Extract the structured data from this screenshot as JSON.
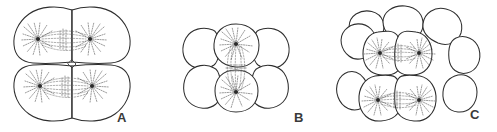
{
  "figure": {
    "type": "scientific-line-drawing",
    "background_color": "#ffffff",
    "ink_color": "#2e2e2e",
    "detail_color": "#6d6d6d",
    "width": 497,
    "height": 132
  },
  "panels": [
    {
      "label": "A",
      "name": "panel-a",
      "description": "four-cell stage, 2 by 2 blastomeres with small central cavity",
      "visible_cells": 4,
      "spindles": 2,
      "spindle_orientation": "horizontal",
      "label_x": 117,
      "label_y": 111
    },
    {
      "label": "B",
      "name": "panel-b",
      "description": "multi-cell stage, six blastomeres with one vertical spindle between the two central cells",
      "visible_cells": 6,
      "spindles": 1,
      "spindle_orientation": "vertical",
      "label_x": 294,
      "label_y": 111
    },
    {
      "label": "C",
      "name": "panel-c",
      "description": "later cleavage stage, many overlapping blastomeres with two horizontal spindles",
      "visible_cells": 12,
      "spindles": 2,
      "spindle_orientation": "horizontal",
      "label_x": 470,
      "label_y": 108
    }
  ]
}
